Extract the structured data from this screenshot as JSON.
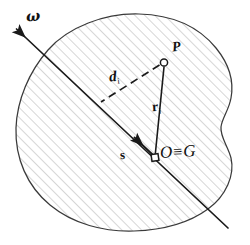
{
  "figure": {
    "body_shape": "irregular-closed-blob",
    "hatching": "diagonal-45-degree-lines",
    "colors": {
      "outline": "#3a3a3a",
      "hatch": "#b9b9b9",
      "vector": "#1a1a1a",
      "label": "#111111",
      "background": "#ffffff"
    },
    "labels": {
      "omega": "ω",
      "point_p": "P",
      "distance_d": "d",
      "distance_d_sub": "i",
      "radius_r": "r",
      "radius_r_sub": "i",
      "vector_s": "s",
      "origin_o": "O",
      "equiv": "≡",
      "centroid_g": "G"
    },
    "geometry": {
      "axis_line": {
        "x1": 14,
        "y1": 27,
        "x2": 228,
        "y2": 228
      },
      "omega_arrow_tip": {
        "x": 14,
        "y": 27
      },
      "point_p": {
        "x": 163,
        "y": 62
      },
      "origin_o": {
        "x": 155,
        "y": 158
      },
      "foot_of_d": {
        "x": 103,
        "y": 101
      },
      "s_arrow_tip": {
        "x": 133,
        "y": 136
      }
    },
    "markers": {
      "p_marker": "open-circle",
      "o_marker": "open-square"
    }
  }
}
